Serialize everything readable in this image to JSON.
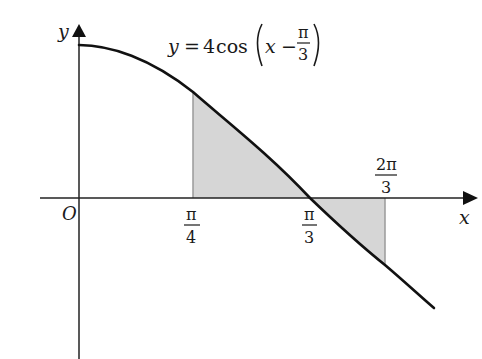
{
  "figure": {
    "type": "function-graph",
    "equation": {
      "lhs": "y",
      "equals": "=",
      "coefficient": "4",
      "func": "cos",
      "arg_var": "x",
      "arg_op": "−",
      "arg_frac_num": "π",
      "arg_frac_den": "3"
    },
    "axes": {
      "x_label": "x",
      "y_label": "y",
      "origin_label": "O"
    },
    "ticks": [
      {
        "id": "pi_over_4",
        "num": "π",
        "den": "4",
        "position": "below"
      },
      {
        "id": "pi_over_3",
        "num": "π",
        "den": "3",
        "position": "below"
      },
      {
        "id": "two_pi_over_3",
        "num": "2π",
        "den": "3",
        "position": "above"
      }
    ],
    "shaded_regions": [
      {
        "from": "π/4",
        "to": "π/3",
        "side": "above x-axis"
      },
      {
        "from": "π/3",
        "to": "2π/3",
        "side": "below x-axis"
      }
    ],
    "colors": {
      "curve": "#111111",
      "axes": "#222222",
      "shading": "#d6d6d6",
      "shading_edge": "#9a9a9a"
    }
  }
}
